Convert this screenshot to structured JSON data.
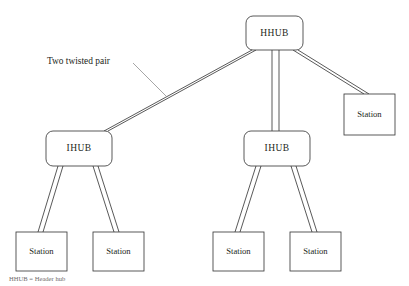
{
  "figure": {
    "background_color": "#ffffff",
    "stroke_color": "#3b3b3b",
    "text_color": "#231f20"
  },
  "nodes": {
    "header_hub": {
      "label": "HHUB",
      "shape": "rounded-rect",
      "x": 246,
      "y": 16,
      "w": 57,
      "h": 34,
      "r": 7
    },
    "intermediate_hubs": [
      {
        "id": "ihub-left",
        "label": "IHUB",
        "shape": "rounded-rect",
        "x": 46,
        "y": 131,
        "w": 66,
        "h": 35,
        "r": 7
      },
      {
        "id": "ihub-right",
        "label": "IHUB",
        "shape": "rounded-rect",
        "x": 244,
        "y": 131,
        "w": 66,
        "h": 35,
        "r": 7
      }
    ],
    "stations": [
      {
        "id": "station-right",
        "label": "Station",
        "shape": "rect",
        "x": 344,
        "y": 94,
        "w": 51,
        "h": 41
      },
      {
        "id": "station-bl-1",
        "label": "Station",
        "shape": "rect",
        "x": 16,
        "y": 232,
        "w": 51,
        "h": 39
      },
      {
        "id": "station-bl-2",
        "label": "Station",
        "shape": "rect",
        "x": 93,
        "y": 232,
        "w": 51,
        "h": 39
      },
      {
        "id": "station-br-1",
        "label": "Station",
        "shape": "rect",
        "x": 213,
        "y": 232,
        "w": 51,
        "h": 39
      },
      {
        "id": "station-br-2",
        "label": "Station",
        "shape": "rect",
        "x": 290,
        "y": 232,
        "w": 51,
        "h": 39
      }
    ]
  },
  "links": [
    {
      "id": "link-hhub-ihub-left",
      "from": "header_hub",
      "to": "ihub-left",
      "style": "two-twisted-pair",
      "a": {
        "x1": 252,
        "y1": 50,
        "x2": 104,
        "y2": 131
      },
      "b": {
        "x1": 256,
        "y1": 50,
        "x2": 108,
        "y2": 131
      }
    },
    {
      "id": "link-hhub-ihub-right",
      "from": "header_hub",
      "to": "ihub-right",
      "style": "two-twisted-pair",
      "a": {
        "x1": 272,
        "y1": 50,
        "x2": 272,
        "y2": 131
      },
      "b": {
        "x1": 279,
        "y1": 50,
        "x2": 279,
        "y2": 131
      }
    },
    {
      "id": "link-hhub-station-right",
      "from": "header_hub",
      "to": "station-right",
      "style": "two-twisted-pair",
      "a": {
        "x1": 293,
        "y1": 50,
        "x2": 364,
        "y2": 94
      },
      "b": {
        "x1": 298,
        "y1": 50,
        "x2": 369,
        "y2": 94
      }
    },
    {
      "id": "link-ihub-left-station-1",
      "from": "ihub-left",
      "to": "station-bl-1",
      "style": "two-twisted-pair",
      "a": {
        "x1": 58,
        "y1": 166,
        "x2": 38,
        "y2": 232
      },
      "b": {
        "x1": 63,
        "y1": 166,
        "x2": 43,
        "y2": 232
      }
    },
    {
      "id": "link-ihub-left-station-2",
      "from": "ihub-left",
      "to": "station-bl-2",
      "style": "two-twisted-pair",
      "a": {
        "x1": 93,
        "y1": 166,
        "x2": 114,
        "y2": 232
      },
      "b": {
        "x1": 98,
        "y1": 166,
        "x2": 119,
        "y2": 232
      }
    },
    {
      "id": "link-ihub-right-station-1",
      "from": "ihub-right",
      "to": "station-br-1",
      "style": "two-twisted-pair",
      "a": {
        "x1": 256,
        "y1": 166,
        "x2": 235,
        "y2": 232
      },
      "b": {
        "x1": 261,
        "y1": 166,
        "x2": 240,
        "y2": 232
      }
    },
    {
      "id": "link-ihub-right-station-2",
      "from": "ihub-right",
      "to": "station-br-2",
      "style": "two-twisted-pair",
      "a": {
        "x1": 291,
        "y1": 166,
        "x2": 312,
        "y2": 232
      },
      "b": {
        "x1": 296,
        "y1": 166,
        "x2": 317,
        "y2": 232
      }
    }
  ],
  "annotation": {
    "label": "Two twisted pair",
    "text_x": 47,
    "text_y": 62,
    "leader": {
      "x1": 133,
      "y1": 63,
      "x2": 166,
      "y2": 96
    }
  },
  "caption": {
    "text": "HHUB = Header hub",
    "x": 9,
    "y": 276
  }
}
